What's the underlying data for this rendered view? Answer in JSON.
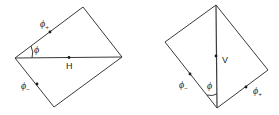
{
  "diagrams": [
    {
      "id": "horizontal",
      "axis_label": "H",
      "angle_label": "ϕ",
      "phi_plus": {
        "symbol": "ϕ",
        "subscript": "+"
      },
      "phi_minus": {
        "symbol": "ϕ",
        "subscript": "−"
      }
    },
    {
      "id": "vertical",
      "axis_label": "V",
      "angle_label": "ϕ",
      "phi_plus": {
        "symbol": "ϕ",
        "subscript": "+"
      },
      "phi_minus": {
        "symbol": "ϕ",
        "subscript": "−"
      }
    }
  ],
  "colors": {
    "line": "#3a3a3a",
    "text": "#222222",
    "background": "#ffffff"
  }
}
